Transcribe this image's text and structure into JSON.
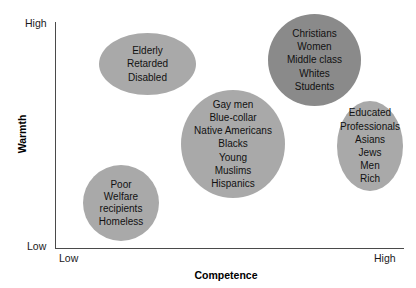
{
  "chart_data": {
    "type": "scatter",
    "title": "",
    "xlabel": "Competence",
    "ylabel": "Warmth",
    "x_ticks": [
      "Low",
      "High"
    ],
    "y_ticks": [
      "Low",
      "High"
    ],
    "grid": false,
    "legend": "none",
    "axis_note": "Two-dimensional stereotype content space; groups plotted as shaded ellipse clusters.",
    "clusters": [
      {
        "id": "elderly",
        "quadrant": "high-warmth / low-competence",
        "warmth": "high",
        "competence": "low",
        "color": "#a9a9a9",
        "cx": 147.5,
        "cy": 64,
        "rx": 48.5,
        "ry": 31,
        "members": [
          "Elderly",
          "Retarded",
          "Disabled"
        ]
      },
      {
        "id": "admired",
        "quadrant": "high-warmth / high-competence",
        "warmth": "high",
        "competence": "high",
        "color": "#8a8a8a",
        "cx": 314.5,
        "cy": 60,
        "rx": 46.5,
        "ry": 46,
        "members": [
          "Christians",
          "Women",
          "Middle class",
          "Whites",
          "Students"
        ]
      },
      {
        "id": "middle",
        "quadrant": "mid-warmth / mid-competence",
        "warmth": "medium",
        "competence": "medium",
        "color": "#a9a9a9",
        "cx": 233,
        "cy": 144,
        "rx": 52,
        "ry": 54,
        "members": [
          "Gay men",
          "Blue-collar",
          "Native Americans",
          "Blacks",
          "Young",
          "Muslims",
          "Hispanics"
        ]
      },
      {
        "id": "envied",
        "quadrant": "low-warmth / high-competence",
        "warmth": "low",
        "competence": "high",
        "color": "#a9a9a9",
        "cx": 370,
        "cy": 146,
        "rx": 33,
        "ry": 45,
        "members": [
          "Educated",
          "Professionals",
          "Asians",
          "Jews",
          "Men",
          "Rich"
        ]
      },
      {
        "id": "poor",
        "quadrant": "low-warmth / low-competence",
        "warmth": "low",
        "competence": "low",
        "color": "#a9a9a9",
        "cx": 121,
        "cy": 203,
        "rx": 38,
        "ry": 38,
        "members": [
          "Poor",
          "Welfare recipients",
          "Homeless"
        ]
      }
    ]
  },
  "axes": {
    "x_title": "Competence",
    "y_title": "Warmth",
    "x_low": "Low",
    "x_high": "High",
    "y_low": "Low",
    "y_high": "High"
  },
  "clusters": {
    "elderly": {
      "line_0": "Elderly",
      "line_1": "Retarded",
      "line_2": "Disabled"
    },
    "admired": {
      "line_0": "Christians",
      "line_1": "Women",
      "line_2": "Middle class",
      "line_3": "Whites",
      "line_4": "Students"
    },
    "middle": {
      "line_0": "Gay men",
      "line_1": "Blue-collar",
      "line_2": "Native Americans",
      "line_3": "Blacks",
      "line_4": "Young",
      "line_5": "Muslims",
      "line_6": "Hispanics"
    },
    "envied": {
      "line_0": "Educated",
      "line_1": "Professionals",
      "line_2": "Asians",
      "line_3": "Jews",
      "line_4": "Men",
      "line_5": "Rich"
    },
    "poor": {
      "line_0": "Poor",
      "line_1": "Welfare",
      "line_2": "recipients",
      "line_3": "Homeless"
    }
  },
  "colors": {
    "cluster_light": "#a9a9a9",
    "cluster_dark": "#8a8a8a",
    "axis": "#4a4a4a",
    "text": "#111111",
    "background": "#ffffff"
  }
}
